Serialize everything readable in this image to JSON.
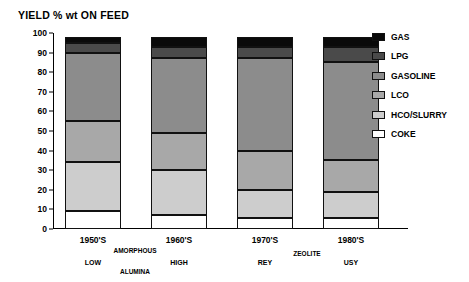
{
  "chart_data": {
    "type": "bar",
    "title": "YIELD % wt ON FEED",
    "xlabel": "",
    "ylabel": "",
    "ylim": [
      0,
      100
    ],
    "yticks": [
      0,
      10,
      20,
      30,
      40,
      50,
      60,
      70,
      80,
      90,
      100
    ],
    "grid": false,
    "stacked": true,
    "legend_position": "right",
    "categories": [
      "1950'S",
      "1960'S",
      "1970'S",
      "1980'S"
    ],
    "category_sub_labels": [
      "LOW",
      "HIGH",
      "REY",
      "USY"
    ],
    "category_groups": [
      {
        "label": "AMORPHOUS",
        "members": [
          "1950'S",
          "1960'S"
        ]
      },
      {
        "label": "ALUMINA",
        "members": [
          "1950'S",
          "1960'S"
        ]
      },
      {
        "label": "ZEOLITE",
        "members": [
          "1970'S",
          "1980'S"
        ]
      }
    ],
    "series": [
      {
        "name": "COKE",
        "color": "#ffffff",
        "values": [
          9,
          7,
          5.5,
          5.5
        ]
      },
      {
        "name": "HCO/SLURRY",
        "color": "#cdcdcd",
        "values": [
          25,
          23,
          14.5,
          13.5
        ]
      },
      {
        "name": "LCO",
        "color": "#a8a8a8",
        "values": [
          21,
          19,
          20,
          16
        ]
      },
      {
        "name": "GASOLINE",
        "color": "#8c8c8c",
        "values": [
          35,
          38,
          47,
          50
        ]
      },
      {
        "name": "LPG",
        "color": "#4a4a4a",
        "values": [
          5,
          6,
          6,
          8
        ]
      },
      {
        "name": "GAS",
        "color": "#0a0a0a",
        "values": [
          3,
          3,
          5,
          5
        ]
      }
    ],
    "stack_tops": {
      "1950'S": {
        "COKE": 9,
        "HCO/SLURRY": 34,
        "LCO": 55,
        "GASOLINE": 90,
        "LPG": 95,
        "GAS": 98
      },
      "1960'S": {
        "COKE": 7,
        "HCO/SLURRY": 30,
        "LCO": 49,
        "GASOLINE": 87,
        "LPG": 93,
        "GAS": 98
      },
      "1970'S": {
        "COKE": 5.5,
        "HCO/SLURRY": 20,
        "LCO": 40,
        "GASOLINE": 87,
        "LPG": 93,
        "GAS": 98
      },
      "1980'S": {
        "COKE": 5.5,
        "HCO/SLURRY": 19,
        "LCO": 35,
        "GASOLINE": 85,
        "LPG": 93,
        "GAS": 98
      }
    }
  },
  "legend": {
    "items": [
      {
        "label": "GAS",
        "color": "#0a0a0a"
      },
      {
        "label": "LPG",
        "color": "#4a4a4a"
      },
      {
        "label": "GASOLINE",
        "color": "#8c8c8c"
      },
      {
        "label": "LCO",
        "color": "#a8a8a8"
      },
      {
        "label": "HCO/SLURRY",
        "color": "#cdcdcd"
      },
      {
        "label": "COKE",
        "color": "#ffffff"
      }
    ]
  }
}
